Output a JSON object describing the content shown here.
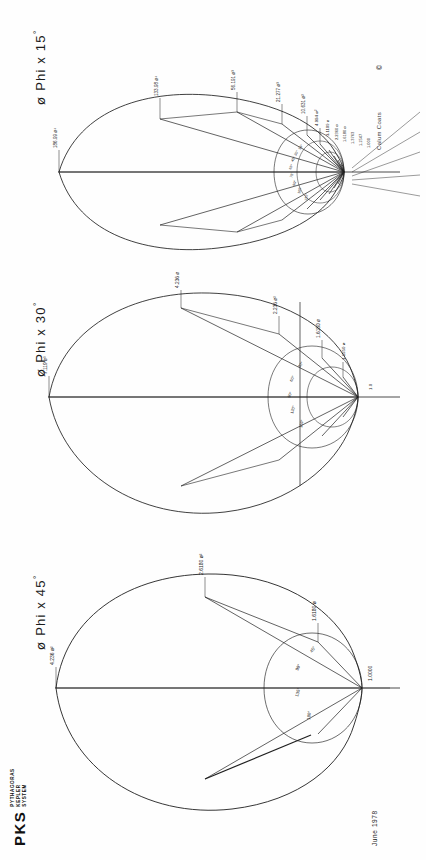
{
  "sheet": {
    "orientation": "landscape-rotated-90",
    "background": "#fefefe",
    "ink": "#1b1b1b"
  },
  "brand": {
    "acronym": "PKS",
    "line1": "PYTHAGORAS",
    "line2": "KEPLER",
    "line3": "SYSTEM"
  },
  "footer": {
    "date": "June 1978",
    "credit": "Calum  Coats",
    "copyright": "©"
  },
  "panels": [
    {
      "id": "phi-15",
      "phi_symbol": "ø",
      "title": "Phi x 15",
      "degree": "°",
      "step_deg": 15,
      "major_labels": [
        {
          "text": "186.99 ø⁴",
          "angle_deg": 180
        },
        {
          "text": "133.98 ø⁴",
          "angle_deg": 150
        },
        {
          "text": "56.191 ø³",
          "angle_deg": 135
        },
        {
          "text": "21.277 ø³",
          "angle_deg": 120
        },
        {
          "text": "10.631 ø²",
          "angle_deg": 105
        },
        {
          "text": "4.994 ø²",
          "angle_deg": 90
        },
        {
          "text": "3.1109 ø",
          "angle_deg": 75
        },
        {
          "text": "2.2360 ø",
          "angle_deg": 60
        },
        {
          "text": "1.6180 ø",
          "angle_deg": 45
        },
        {
          "text": "1.3763",
          "angle_deg": 30
        },
        {
          "text": "1.1547",
          "angle_deg": 15
        },
        {
          "text": "1.000",
          "angle_deg": 0
        }
      ],
      "tick_labels": [
        "15°",
        "30°",
        "45°",
        "60°",
        "75°",
        "90°",
        "105°",
        "120°",
        "135°",
        "150°",
        "165°",
        "180°"
      ]
    },
    {
      "id": "phi-30",
      "phi_symbol": "ø",
      "title": "Phi x 30",
      "degree": "°",
      "step_deg": 30,
      "major_labels": [
        {
          "text": "7.119 ø³",
          "angle_deg": 180
        },
        {
          "text": "4.236 ø²",
          "angle_deg": 150
        },
        {
          "text": "2.236 ø²",
          "angle_deg": 120
        },
        {
          "text": "1.6180 ø",
          "angle_deg": 90
        },
        {
          "text": "1.1550 ø",
          "angle_deg": 60
        },
        {
          "text": "1.0",
          "angle_deg": 0
        }
      ],
      "tick_labels": [
        "30°",
        "60°",
        "90°",
        "120°",
        "150°",
        "180°"
      ]
    },
    {
      "id": "phi-45",
      "phi_symbol": "ø",
      "title": "Phi x 45",
      "degree": "°",
      "step_deg": 45,
      "major_labels": [
        {
          "text": "4.236 ø²",
          "angle_deg": 180
        },
        {
          "text": "2.6180 ø²",
          "angle_deg": 135
        },
        {
          "text": "1.6180 ø",
          "angle_deg": 90
        },
        {
          "text": "1.0000",
          "angle_deg": 0
        }
      ],
      "tick_labels": [
        "45°",
        "90°",
        "135°",
        "180°"
      ]
    }
  ]
}
